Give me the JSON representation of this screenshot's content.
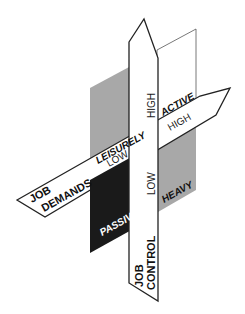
{
  "diagram": {
    "type": "karasek-job-strain-model",
    "colors": {
      "background": "#ffffff",
      "gray_plane": "#a8a8a8",
      "dark_plane": "#1a1a1a",
      "white_plane": "#ffffff",
      "outline": "#222222"
    },
    "axes": {
      "demands": {
        "title_line1": "JOB",
        "title_line2": "DEMANDS",
        "low_label": "LOW",
        "high_label": "HIGH"
      },
      "control": {
        "title_line1": "JOB",
        "title_line2": "CONTROL",
        "low_label": "LOW",
        "high_label": "HIGH"
      }
    },
    "quadrants": {
      "leisurely": "LEISURELY",
      "active": "ACTIVE",
      "passive": "PASSIVE",
      "heavy": "HEAVY"
    }
  }
}
